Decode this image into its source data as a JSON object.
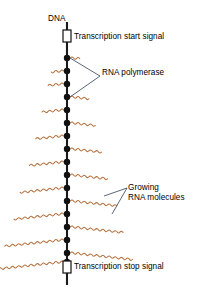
{
  "diagram": {
    "type": "biology-schematic",
    "canvas": {
      "width": 202,
      "height": 297,
      "background": "#ffffff"
    },
    "colors": {
      "dna_strand": "#1a1a1a",
      "polymerase_dot": "#111111",
      "rna_molecule": "#b5703c",
      "leader_line": "#3b4a63",
      "text": "#000000",
      "signal_box_fill": "#ffffff",
      "signal_box_stroke": "#111111"
    },
    "labels": {
      "dna": "DNA",
      "start_signal": "Transcription start signal",
      "polymerase": "RNA polymerase",
      "growing_rna": "Growing",
      "growing_rna_line2": "RNA molecules",
      "stop_signal": "Transcription stop signal"
    },
    "dna_strand": {
      "x": 67,
      "y_top": 22,
      "y_bottom": 285,
      "stroke_width": 2.1
    },
    "signals": [
      {
        "name": "transcription-start-signal",
        "x": 67,
        "y": 36,
        "w": 8,
        "h": 12
      },
      {
        "name": "transcription-stop-signal",
        "x": 67,
        "y": 267,
        "w": 8,
        "h": 12
      }
    ],
    "polymerases": [
      {
        "y": 58,
        "side": "right",
        "rna_length": 10
      },
      {
        "y": 71,
        "side": "left",
        "rna_length": 13
      },
      {
        "y": 84,
        "side": "left",
        "rna_length": 16
      },
      {
        "y": 97,
        "side": "right",
        "rna_length": 19
      },
      {
        "y": 110,
        "side": "left",
        "rna_length": 22
      },
      {
        "y": 123,
        "side": "right",
        "rna_length": 25
      },
      {
        "y": 136,
        "side": "left",
        "rna_length": 28
      },
      {
        "y": 149,
        "side": "right",
        "rna_length": 31
      },
      {
        "y": 162,
        "side": "left",
        "rna_length": 35
      },
      {
        "y": 175,
        "side": "right",
        "rna_length": 38
      },
      {
        "y": 188,
        "side": "left",
        "rna_length": 42
      },
      {
        "y": 201,
        "side": "right",
        "rna_length": 46
      },
      {
        "y": 214,
        "side": "left",
        "rna_length": 50
      },
      {
        "y": 227,
        "side": "right",
        "rna_length": 54
      },
      {
        "y": 240,
        "side": "left",
        "rna_length": 58
      },
      {
        "y": 253,
        "side": "right",
        "rna_length": 62
      },
      {
        "y": 262,
        "side": "left",
        "rna_length": 66
      }
    ],
    "dot_radius": 3.2,
    "leaders": {
      "polymerase": [
        {
          "from": [
            100,
            76
          ],
          "to": [
            70,
            58
          ]
        },
        {
          "from": [
            100,
            76
          ],
          "to": [
            70,
            97
          ]
        }
      ],
      "growing_rna": [
        {
          "from": [
            127,
            188
          ],
          "to": [
            104,
            196
          ]
        },
        {
          "from": [
            127,
            188
          ],
          "to": [
            112,
            214
          ]
        }
      ]
    }
  }
}
